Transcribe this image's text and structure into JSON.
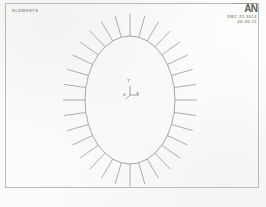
{
  "document": {
    "kind": "ansys-element-plot",
    "caption": ""
  },
  "frame": {
    "border_color": "#b9b9b6"
  },
  "header": {
    "title": "ELEMENTS",
    "logo": "AN",
    "logo_name": "ansys-logo",
    "date": "DEC 23 2013",
    "time": "20:35:11"
  },
  "triad": {
    "y_label": "Y",
    "z_label": "Z",
    "x_label": "X"
  },
  "colors": {
    "line": "#8b8b88",
    "text": "#8f8f8c",
    "paper": "#fdfdfc"
  },
  "chart_data": {
    "type": "scatter",
    "title": "ELEMENTS",
    "xlabel": "",
    "ylabel": "",
    "ellipse": {
      "center_x": 130,
      "center_y": 100,
      "radius_x": 45,
      "radius_y": 64,
      "segments": 32
    },
    "spokes": {
      "count": 32,
      "length": 22,
      "start_angle_deg": 0
    },
    "grid": false,
    "legend": "none"
  }
}
